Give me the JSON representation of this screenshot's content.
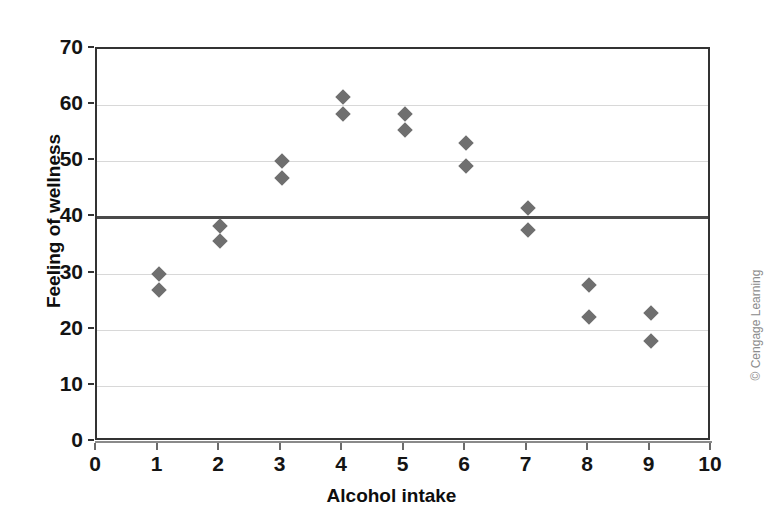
{
  "chart_data": {
    "type": "scatter",
    "title": "",
    "xlabel": "Alcohol intake",
    "ylabel": "Feeling of wellness",
    "xlim": [
      0,
      10
    ],
    "ylim": [
      0,
      70
    ],
    "xticks": [
      "0",
      "1",
      "2",
      "3",
      "4",
      "5",
      "6",
      "7",
      "8",
      "9",
      "10"
    ],
    "yticks": [
      "0",
      "10",
      "20",
      "30",
      "40",
      "50",
      "60",
      "70"
    ],
    "grid": "horizontal",
    "legend": "none",
    "marker": "diamond",
    "marker_color": "#6f6f6f",
    "reference_line": {
      "value": 40,
      "orientation": "horizontal",
      "color": "#4a4a4a"
    },
    "points": [
      {
        "x": 1,
        "y": 30.0
      },
      {
        "x": 1,
        "y": 27.0
      },
      {
        "x": 2,
        "y": 38.5
      },
      {
        "x": 2,
        "y": 35.8
      },
      {
        "x": 3,
        "y": 50.0
      },
      {
        "x": 3,
        "y": 47.0
      },
      {
        "x": 4,
        "y": 61.5
      },
      {
        "x": 4,
        "y": 58.5
      },
      {
        "x": 5,
        "y": 58.4
      },
      {
        "x": 5,
        "y": 55.5
      },
      {
        "x": 6,
        "y": 53.3
      },
      {
        "x": 6,
        "y": 49.2
      },
      {
        "x": 7,
        "y": 41.7
      },
      {
        "x": 7,
        "y": 37.8
      },
      {
        "x": 8,
        "y": 28.0
      },
      {
        "x": 8,
        "y": 22.3
      },
      {
        "x": 9,
        "y": 23.0
      },
      {
        "x": 9,
        "y": 18.0
      }
    ]
  },
  "credit": {
    "text": "© Cengage Learning"
  },
  "colors": {
    "marker": "#6f6f6f",
    "frame": "#333333",
    "gridline": "#d8d8d8",
    "reference_line": "#4a4a4a",
    "text": "#141414",
    "credit": "#8c8c8c",
    "background": "#ffffff"
  }
}
